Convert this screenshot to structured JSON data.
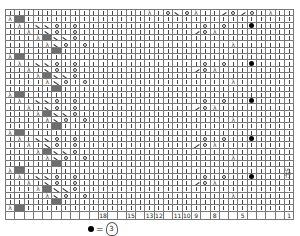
{
  "chart": {
    "columns": 31,
    "legend_key": "k=knit |, o=yarn over, r=ssk \\, l=k2tog /, a=sk2p, g=no stitch (gray), b=bobble, .=blank",
    "rows": [
      "kkkkkkkkkkkkkkkakoroakklolokakkkkkkkkkkkkkkkkkk",
      "agkkkkkkkkkkkkkkkkkkkkkkkkkkkkk",
      "kakrrokokkkkkkkkkkkkkokokkbkkkk",
      "kkakrokokkkkkkkkkkkkloakkkkkkkk",
      "kkkagrrokkkkkkkkkkkkkkkkkkkkkkk",
      "kkkkarokokkkkkkkkkkkkkkkakkkkkk",
      "kkkkkgkkkkkkkkkkkkkkkkkkkkkkkkk",
      "agkkkkkkkkkkkkkkkkkkkkkkkkkkkkk",
      "kakrrokokkkkkkkkkkkkkokokkbkkkk",
      "kkakrokokkkkkkkkkkkkloakkkkkkkk",
      "kkkagrrokkkkkkkkkkkkkkkkkkkkkkk",
      "kkkkarokokkkkkkkkkkkkkkkakkkkkk",
      "kkkkkgkkkkkkkkkkkkkkkkkkkkkkkkk",
      "agkkkkkkkkkkkkkkkkkkkkkkkkkkkkk",
      "kakrrokokkkkkkkkkkkkkokokkbkkkk",
      "kkakrokokkkkkkkkkkkkloakkkkkkkk",
      "kkkagrrokkkkkkkkkkkkkkkkkkkkkkk",
      "kkkkarokokkkkkkkkkkkkkkkakkkkkk",
      "kkkkkgkkkkkkkkkkkkkkkkkkkkkkkkk",
      "agkkkkkkkkkkkkkkkkkkkkkkkkkkkkk",
      "kakrrokokkkkkkkkkkkkkokokkbkkkk",
      "kkakrokokkkkkkkkkkkkloakkkkkkkk",
      "kkkagrrokkkkkkkkkkkkkkkkkkkkkkk",
      "kkkkarokokkkkkkkkkkkkkkkakkkkkk",
      "kkkkkgkkkkkkkkkkkkkkkkkkkkkkkkk",
      "agkkkkkkkkkkkkkkkkkkkkkkkkkkkkk",
      "kakrrokokkkkkkkkkkkkkokokkbkkkk",
      "kkakrokokkkkkkkkkkkkloakkkkkkkk",
      "kkkagrrokkkkkkkkkkkkkkkkkkkkkkk",
      "kkkkarokokkkkkkkkkkkkkkkakkkkkk",
      "kkkkkgkkkkkkkkkkkkkkkkkkkkkkkkk",
      "agkkkkkkkkkkkkkkkkkkkkkkkkkkkkk"
    ],
    "column_numbers": [
      "",
      "",
      "",
      "",
      "",
      "",
      "",
      "",
      "",
      "",
      "18",
      "",
      "",
      "15",
      "",
      "13",
      "12",
      "",
      "11",
      "10",
      "9",
      "",
      "8",
      "",
      "",
      "5",
      "",
      "",
      "",
      "",
      "1"
    ]
  },
  "side_label": "5行",
  "legend": {
    "bobble_symbol": "●",
    "equals": "=",
    "bobble_definition_count": "3"
  }
}
